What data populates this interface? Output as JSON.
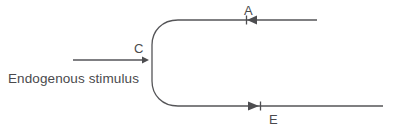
{
  "diagram": {
    "background_color": "#ffffff",
    "stroke_color": "#555558",
    "arrow_color": "#4d4d50",
    "text_color": "#4a4a4d",
    "caption": {
      "text": "Endogenous stimulus",
      "x": 8,
      "y": 83
    },
    "labels": {
      "c": {
        "text": "C",
        "x": 134,
        "y": 53,
        "description": "label above the endogenous stimulus input arrow"
      },
      "a": {
        "text": "A",
        "x": 244,
        "y": 15,
        "description": "label above the inbound arrow on the top branch"
      },
      "e": {
        "text": "E",
        "x": 269,
        "y": 124,
        "description": "label below the outbound arrow on the bottom branch"
      }
    },
    "geometry": {
      "top_line_y": 20,
      "bottom_line_y": 106,
      "loop_left_x": 152,
      "loop_join_x": 172,
      "top_line_right_x": 317,
      "bottom_line_right_x": 383,
      "stimulus_arrow": {
        "y": 60,
        "x_start": 73,
        "x_end": 148,
        "direction": "right"
      },
      "arrow_a": {
        "x": 252,
        "y": 20,
        "direction": "left",
        "tick_x": 246
      },
      "arrow_e": {
        "x": 253,
        "y": 106,
        "direction": "right",
        "tick_x": 259
      }
    }
  }
}
